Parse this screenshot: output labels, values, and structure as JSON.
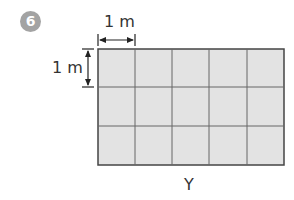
{
  "problem": {
    "number": "6"
  },
  "diagram": {
    "width_label": "1 m",
    "height_label": "1 m",
    "caption": "Y",
    "grid": {
      "columns": 5,
      "rows": 3,
      "cell_unit": "1 m",
      "fill_color": "#e3e3e3",
      "line_color": "#555555"
    },
    "badge_color": "#a3a3a3"
  }
}
